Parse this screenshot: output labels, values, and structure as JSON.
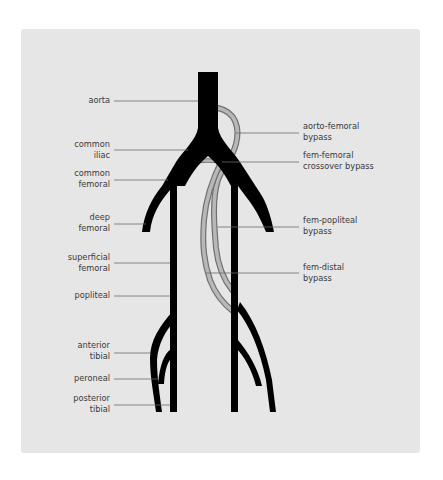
{
  "diagram": {
    "colors": {
      "background_panel": "#e6e6e6",
      "artery": "#000000",
      "bypass_graft_fill": "#b8b8b8",
      "bypass_graft_outline": "#6f6f6f",
      "leader_line": "#6a6a6a",
      "label_text": "#3a3a3a"
    },
    "left_labels": [
      {
        "id": "aorta",
        "text": "aorta"
      },
      {
        "id": "common-iliac",
        "text": "common\niliac"
      },
      {
        "id": "common-femoral",
        "text": "common\nfemoral"
      },
      {
        "id": "deep-femoral",
        "text": "deep\nfemoral"
      },
      {
        "id": "superficial-femoral",
        "text": "superficial\nfemoral"
      },
      {
        "id": "popliteal",
        "text": "popliteal"
      },
      {
        "id": "anterior-tibial",
        "text": "anterior\ntibial"
      },
      {
        "id": "peroneal",
        "text": "peroneal"
      },
      {
        "id": "posterior-tibial",
        "text": "posterior\ntibial"
      }
    ],
    "right_labels": [
      {
        "id": "aorto-femoral-bypass",
        "text": "aorto-femoral\nbypass"
      },
      {
        "id": "fem-femoral-crossover-bypass",
        "text": "fem-femoral\ncrossover bypass"
      },
      {
        "id": "fem-popliteal-bypass",
        "text": "fem-popliteal\nbypass"
      },
      {
        "id": "fem-distal-bypass",
        "text": "fem-distal\nbypass"
      }
    ]
  }
}
